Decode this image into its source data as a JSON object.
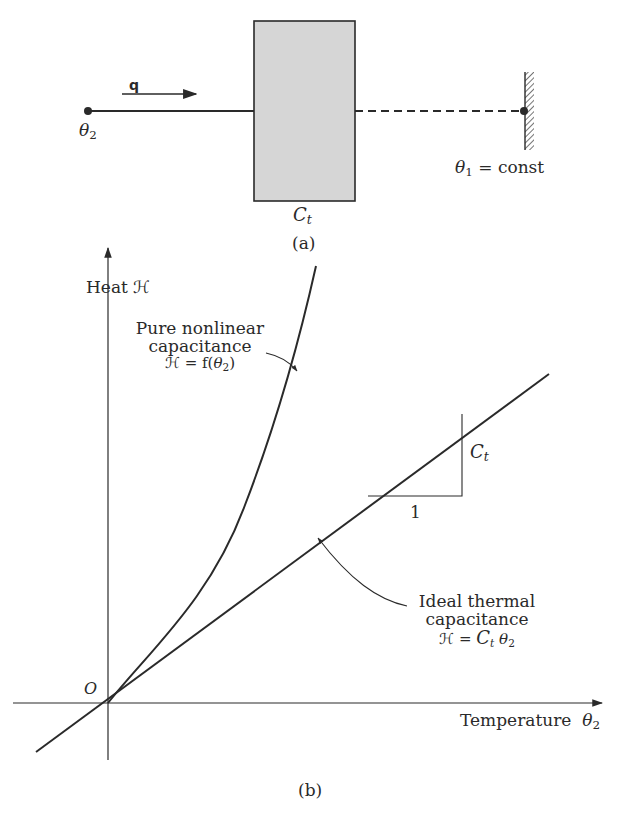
{
  "panel_a": {
    "caption": "(a)",
    "flow_label": "q",
    "left_node_label_symbol": "θ",
    "left_node_label_sub": "2",
    "right_node_label_symbol": "θ",
    "right_node_label_sub": "1",
    "right_node_label_suffix": " = const",
    "capacitor_label_symbol": "C",
    "capacitor_label_sub": "t"
  },
  "panel_b": {
    "caption": "(b)",
    "y_axis_label": "Heat ℋ",
    "x_axis_label": "Temperature",
    "x_axis_symbol": "θ",
    "x_axis_sub": "2",
    "origin_label": "O",
    "nonlinear_line1": "Pure nonlinear",
    "nonlinear_line2": "capacitance",
    "nonlinear_eq_prefix": "ℋ = f(",
    "nonlinear_eq_symbol": "θ",
    "nonlinear_eq_sub": "2",
    "nonlinear_eq_suffix": ")",
    "linear_line1": "Ideal thermal",
    "linear_line2": "capacitance",
    "linear_eq_prefix": "ℋ = ",
    "linear_eq_C": "C",
    "linear_eq_C_sub": "t",
    "linear_eq_symbol": "θ",
    "linear_eq_sub": "2",
    "slope_run_label": "1",
    "slope_rise_symbol": "C",
    "slope_rise_sub": "t"
  },
  "colors": {
    "ink": "#2a2a2a",
    "box_fill": "#d6d6d6",
    "background": "#ffffff"
  }
}
